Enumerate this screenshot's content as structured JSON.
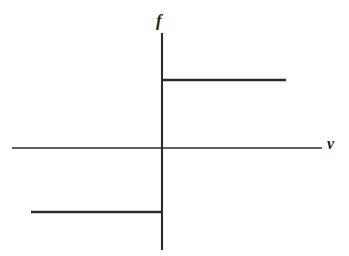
{
  "figure": {
    "background_color": "#ffffff",
    "line_color": "#2b2b2b",
    "width": 349,
    "height": 256
  },
  "labels": {
    "vertical_axis": "f",
    "horizontal_axis": "v"
  },
  "chart_data": {
    "type": "line",
    "title": "",
    "subtitle": "",
    "xlabel": "v",
    "ylabel": "f",
    "grid": false,
    "legend": null,
    "axis_style": "centered-cross",
    "xlim": [
      -1,
      1
    ],
    "ylim": [
      -1.2,
      1.2
    ],
    "series": [
      {
        "name": "negative-branch",
        "x": [
          -0.95,
          0.0
        ],
        "values": [
          -1,
          -1
        ]
      },
      {
        "name": "jump-at-origin",
        "x": [
          0.0,
          0.0
        ],
        "values": [
          -1,
          1
        ]
      },
      {
        "name": "positive-branch",
        "x": [
          0.0,
          0.78
        ],
        "values": [
          1,
          1
        ]
      }
    ],
    "annotations": [
      {
        "text": "f",
        "x": 0.0,
        "y": 1.6
      },
      {
        "text": "v",
        "x": 1.06,
        "y": 0.0
      }
    ]
  },
  "geometry": {
    "x_axis": {
      "x1": 12,
      "y1": 148,
      "x2": 322,
      "y2": 148
    },
    "y_axis": {
      "x1": 162,
      "y1": 33,
      "x2": 162,
      "y2": 250
    },
    "upper_step": {
      "x1": 162,
      "y1": 80,
      "x2": 286,
      "y2": 80
    },
    "lower_step": {
      "x1": 31,
      "y1": 212,
      "x2": 162,
      "y2": 212
    }
  }
}
